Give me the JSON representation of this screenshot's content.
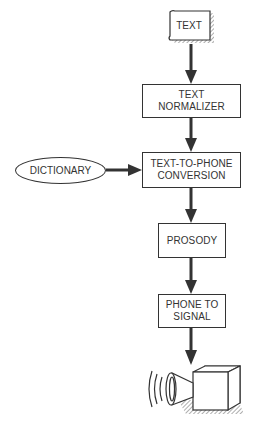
{
  "diagram": {
    "input": {
      "label": "TEXT",
      "shape": "document"
    },
    "dictionary": {
      "label": "DICTIONARY",
      "shape": "ellipse"
    },
    "steps": [
      {
        "id": "normalizer",
        "line1": "TEXT",
        "line2": "NORMALIZER"
      },
      {
        "id": "t2p",
        "line1": "TEXT-TO-PHONE",
        "line2": "CONVERSION"
      },
      {
        "id": "prosody",
        "line1": "PROSODY",
        "line2": ""
      },
      {
        "id": "p2s",
        "line1": "PHONE TO",
        "line2": "SIGNAL"
      }
    ],
    "output": {
      "icon": "loudspeaker-icon"
    },
    "edges": [
      [
        "TEXT",
        "TEXT NORMALIZER"
      ],
      [
        "TEXT NORMALIZER",
        "TEXT-TO-PHONE CONVERSION"
      ],
      [
        "DICTIONARY",
        "TEXT-TO-PHONE CONVERSION"
      ],
      [
        "TEXT-TO-PHONE CONVERSION",
        "PROSODY"
      ],
      [
        "PROSODY",
        "PHONE TO SIGNAL"
      ],
      [
        "PHONE TO SIGNAL",
        "loudspeaker"
      ]
    ],
    "colors": {
      "stroke": "#333333",
      "background": "#ffffff",
      "hatch": "#888888"
    }
  }
}
